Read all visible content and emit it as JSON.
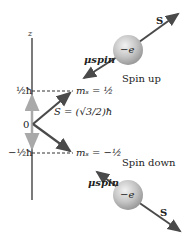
{
  "diagram": {
    "axis_label": "z",
    "origin_label": "0",
    "level_up": "½ħ",
    "level_down": "−½ħ",
    "ms_up": "mₛ = ½",
    "ms_down": "mₛ = −½",
    "magnitude": "S = (√3/2)ħ",
    "spin_up": {
      "caption": "Spin up",
      "particle": "−e",
      "spin_vector": "S",
      "moment_vector": "μspin"
    },
    "spin_down": {
      "caption": "Spin down",
      "particle": "−e",
      "spin_vector": "S",
      "moment_vector": "μspin"
    },
    "colors": {
      "axis": "#333333",
      "projection_arrow": "#a9a9a9",
      "vector": "#4a4a4a",
      "sphere": "#c8c8c8"
    }
  }
}
